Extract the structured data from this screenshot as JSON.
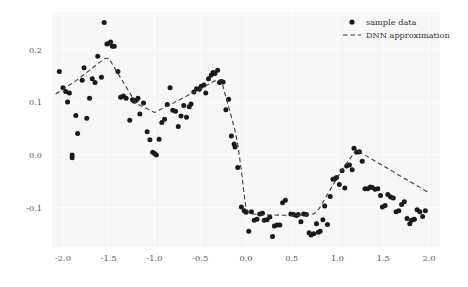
{
  "chart_data": {
    "type": "scatter",
    "title": "",
    "xlabel": "",
    "ylabel": "",
    "xlim": [
      -2.12,
      2.12
    ],
    "ylim": [
      -0.175,
      0.272
    ],
    "grid": true,
    "grid_color": "#ffffff",
    "background_color": "#f7f7f7",
    "figure_color": "#ffffff",
    "marker_color": "#1a1a1a",
    "line_color": "#3a3a3a",
    "xticks": [
      -2.0,
      -1.5,
      -1.0,
      -0.5,
      0.0,
      0.5,
      1.0,
      1.5,
      2.0
    ],
    "xtick_labels": [
      "-2.0",
      "-1.5",
      "-1.0",
      "-0.5",
      "0.0",
      "0.5",
      "1.0",
      "1.5",
      "2.0"
    ],
    "yticks": [
      -0.1,
      0.0,
      0.1,
      0.2
    ],
    "ytick_labels": [
      "-0.1",
      "0.0",
      "0.1",
      "0.2"
    ],
    "legend": {
      "position": "upper right",
      "entries": [
        {
          "label": "sample data",
          "style": "marker",
          "symbol": "dot"
        },
        {
          "label": "DNN approximation",
          "style": "dashed-line",
          "symbol": "dash"
        }
      ]
    },
    "series": [
      {
        "name": "sample data",
        "type": "scatter",
        "points": [
          [
            -2.04,
            0.159
          ],
          [
            -2.0,
            0.128
          ],
          [
            -1.97,
            0.121
          ],
          [
            -1.95,
            0.101
          ],
          [
            -1.93,
            0.118
          ],
          [
            -1.9,
            0.0
          ],
          [
            -1.9,
            -0.005
          ],
          [
            -1.86,
            0.075
          ],
          [
            -1.84,
            0.041
          ],
          [
            -1.79,
            0.142
          ],
          [
            -1.77,
            0.166
          ],
          [
            -1.74,
            0.07
          ],
          [
            -1.71,
            0.108
          ],
          [
            -1.68,
            0.145
          ],
          [
            -1.65,
            0.138
          ],
          [
            -1.62,
            0.188
          ],
          [
            -1.58,
            0.148
          ],
          [
            -1.55,
            0.252
          ],
          [
            -1.52,
            0.211
          ],
          [
            -1.5,
            0.212
          ],
          [
            -1.48,
            0.215
          ],
          [
            -1.46,
            0.207
          ],
          [
            -1.44,
            0.207
          ],
          [
            -1.4,
            0.159
          ],
          [
            -1.37,
            0.11
          ],
          [
            -1.34,
            0.112
          ],
          [
            -1.31,
            0.108
          ],
          [
            -1.27,
            0.066
          ],
          [
            -1.24,
            0.105
          ],
          [
            -1.22,
            0.102
          ],
          [
            -1.2,
            0.104
          ],
          [
            -1.18,
            0.108
          ],
          [
            -1.16,
            0.078
          ],
          [
            -1.12,
            0.099
          ],
          [
            -1.08,
            0.044
          ],
          [
            -1.05,
            0.029
          ],
          [
            -1.02,
            0.005
          ],
          [
            -1.0,
            0.003
          ],
          [
            -0.98,
            0.0
          ],
          [
            -0.95,
            0.03
          ],
          [
            -0.92,
            0.062
          ],
          [
            -0.89,
            0.068
          ],
          [
            -0.86,
            0.096
          ],
          [
            -0.83,
            0.128
          ],
          [
            -0.8,
            0.085
          ],
          [
            -0.77,
            0.083
          ],
          [
            -0.74,
            0.054
          ],
          [
            -0.71,
            0.074
          ],
          [
            -0.68,
            0.094
          ],
          [
            -0.65,
            0.072
          ],
          [
            -0.62,
            0.092
          ],
          [
            -0.6,
            0.097
          ],
          [
            -0.57,
            0.12
          ],
          [
            -0.54,
            0.126
          ],
          [
            -0.51,
            0.125
          ],
          [
            -0.49,
            0.131
          ],
          [
            -0.46,
            0.133
          ],
          [
            -0.44,
            0.118
          ],
          [
            -0.41,
            0.145
          ],
          [
            -0.38,
            0.152
          ],
          [
            -0.36,
            0.157
          ],
          [
            -0.34,
            0.155
          ],
          [
            -0.31,
            0.161
          ],
          [
            -0.29,
            0.138
          ],
          [
            -0.27,
            0.14
          ],
          [
            -0.25,
            0.139
          ],
          [
            -0.22,
            0.086
          ],
          [
            -0.19,
            0.106
          ],
          [
            -0.16,
            0.036
          ],
          [
            -0.13,
            0.021
          ],
          [
            -0.12,
            0.015
          ],
          [
            -0.09,
            -0.024
          ],
          [
            -0.05,
            -0.099
          ],
          [
            -0.02,
            -0.106
          ],
          [
            0.0,
            -0.109
          ],
          [
            0.03,
            -0.145
          ],
          [
            0.06,
            -0.108
          ],
          [
            0.09,
            -0.124
          ],
          [
            0.12,
            -0.122
          ],
          [
            0.15,
            -0.112
          ],
          [
            0.18,
            -0.111
          ],
          [
            0.2,
            -0.124
          ],
          [
            0.23,
            -0.123
          ],
          [
            0.26,
            -0.118
          ],
          [
            0.29,
            -0.155
          ],
          [
            0.31,
            -0.135
          ],
          [
            0.34,
            -0.133
          ],
          [
            0.37,
            -0.133
          ],
          [
            0.4,
            -0.091
          ],
          [
            0.43,
            -0.086
          ],
          [
            0.49,
            -0.112
          ],
          [
            0.52,
            -0.113
          ],
          [
            0.55,
            -0.115
          ],
          [
            0.57,
            -0.113
          ],
          [
            0.6,
            -0.127
          ],
          [
            0.63,
            -0.112
          ],
          [
            0.66,
            -0.113
          ],
          [
            0.69,
            -0.148
          ],
          [
            0.71,
            -0.152
          ],
          [
            0.74,
            -0.15
          ],
          [
            0.77,
            -0.131
          ],
          [
            0.79,
            -0.147
          ],
          [
            0.81,
            -0.145
          ],
          [
            0.84,
            -0.123
          ],
          [
            0.86,
            -0.097
          ],
          [
            0.89,
            -0.132
          ],
          [
            0.92,
            -0.079
          ],
          [
            0.95,
            -0.046
          ],
          [
            0.97,
            -0.045
          ],
          [
            0.99,
            -0.043
          ],
          [
            1.02,
            -0.056
          ],
          [
            1.05,
            -0.03
          ],
          [
            1.08,
            -0.063
          ],
          [
            1.1,
            -0.021
          ],
          [
            1.13,
            -0.019
          ],
          [
            1.16,
            -0.028
          ],
          [
            1.18,
            0.013
          ],
          [
            1.21,
            0.005
          ],
          [
            1.24,
            0.006
          ],
          [
            1.27,
            -0.012
          ],
          [
            1.3,
            -0.064
          ],
          [
            1.33,
            -0.064
          ],
          [
            1.36,
            -0.061
          ],
          [
            1.38,
            -0.062
          ],
          [
            1.41,
            -0.065
          ],
          [
            1.44,
            -0.064
          ],
          [
            1.47,
            -0.077
          ],
          [
            1.49,
            -0.099
          ],
          [
            1.52,
            -0.096
          ],
          [
            1.55,
            -0.075
          ],
          [
            1.58,
            -0.08
          ],
          [
            1.61,
            -0.082
          ],
          [
            1.64,
            -0.108
          ],
          [
            1.67,
            -0.106
          ],
          [
            1.7,
            -0.094
          ],
          [
            1.73,
            -0.089
          ],
          [
            1.76,
            -0.121
          ],
          [
            1.79,
            -0.131
          ],
          [
            1.81,
            -0.124
          ],
          [
            1.84,
            -0.122
          ],
          [
            1.87,
            -0.104
          ],
          [
            1.9,
            -0.108
          ],
          [
            1.93,
            -0.117
          ],
          [
            1.96,
            -0.106
          ]
        ]
      },
      {
        "name": "DNN approximation",
        "type": "line",
        "linestyle": "dashed",
        "vertices": [
          [
            -2.08,
            0.116
          ],
          [
            -1.86,
            0.141
          ],
          [
            -1.55,
            0.183
          ],
          [
            -1.5,
            0.184
          ],
          [
            -1.2,
            0.098
          ],
          [
            -1.0,
            0.081
          ],
          [
            -0.86,
            0.093
          ],
          [
            -0.52,
            0.124
          ],
          [
            -0.34,
            0.141
          ],
          [
            -0.27,
            0.143
          ],
          [
            -0.22,
            0.11
          ],
          [
            -0.16,
            0.073
          ],
          [
            -0.12,
            0.046
          ],
          [
            -0.09,
            0.02
          ],
          [
            -0.05,
            -0.03
          ],
          [
            -0.02,
            -0.076
          ],
          [
            0.0,
            -0.1
          ],
          [
            0.04,
            -0.112
          ],
          [
            0.24,
            -0.114
          ],
          [
            0.55,
            -0.115
          ],
          [
            0.74,
            -0.112
          ],
          [
            0.8,
            -0.102
          ],
          [
            0.9,
            -0.072
          ],
          [
            1.05,
            -0.028
          ],
          [
            1.21,
            0.011
          ],
          [
            1.24,
            0.006
          ],
          [
            2.0,
            -0.072
          ]
        ]
      }
    ]
  }
}
